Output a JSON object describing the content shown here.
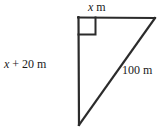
{
  "figure": {
    "background_color": "#ffffff",
    "stroke_color": "#2b2b2b",
    "text_color": "#1a1a1a",
    "labels": {
      "top_side": {
        "variable": "x",
        "unit": "m",
        "full": "x m"
      },
      "left_side": {
        "variable": "x",
        "expression": "+ 20",
        "unit": "m",
        "full": "x + 20 m"
      },
      "hypotenuse": {
        "value": "100",
        "unit": "m",
        "full": "100 m"
      }
    },
    "right_angle": {
      "marker": "square",
      "location": "top-left-vertex"
    },
    "geometry": {
      "vertices": {
        "top_left": [
          78,
          17
        ],
        "top_right": [
          155,
          18
        ],
        "bottom_left": [
          79,
          125
        ]
      },
      "right_angle_marker": {
        "x": 78,
        "y": 17,
        "size": 17
      }
    }
  }
}
